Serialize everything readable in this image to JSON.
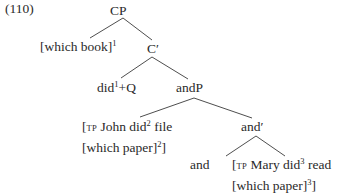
{
  "example_number": "(110)",
  "tree": {
    "root": "CP",
    "spec_cp": {
      "text": "[which book]",
      "index": "1"
    },
    "c_bar": "C′",
    "c_head": {
      "pre": "did",
      "index": "1",
      "post": "+Q"
    },
    "andP": "andP",
    "conjunct1": {
      "open": "[",
      "label": "TP",
      "line1_text": " John did",
      "index": "2",
      "line1_tail": " file",
      "line2_text": "[which paper]",
      "line2_index": "2",
      "line2_close": "]"
    },
    "and_bar": "and′",
    "and_head": "and",
    "conjunct2": {
      "open": "[",
      "label": "TP",
      "line1_text": " Mary did",
      "index": "3",
      "line1_tail": " read",
      "line2_text": "[which paper]",
      "line2_index": "3",
      "line2_close": "]"
    }
  },
  "edges": [
    {
      "from": "CP",
      "to": "spec-cp"
    },
    {
      "from": "CP",
      "to": "C-bar"
    },
    {
      "from": "C-bar",
      "to": "C-head"
    },
    {
      "from": "C-bar",
      "to": "andP"
    },
    {
      "from": "andP",
      "to": "conjunct1"
    },
    {
      "from": "andP",
      "to": "and-bar"
    },
    {
      "from": "and-bar",
      "to": "and-head"
    },
    {
      "from": "and-bar",
      "to": "conjunct2"
    }
  ]
}
